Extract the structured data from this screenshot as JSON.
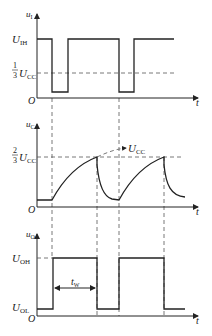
{
  "diagram": {
    "panels": [
      {
        "id": "input",
        "y_axis_label": "u",
        "y_axis_sub": "I",
        "x_axis_label": "t",
        "origin_label": "O",
        "levels": [
          {
            "label": "U",
            "sub": "IH"
          },
          {
            "frac_num": "1",
            "frac_den": "3",
            "label": "U",
            "sub": "CC"
          }
        ]
      },
      {
        "id": "capacitor",
        "y_axis_label": "u",
        "y_axis_sub": "C",
        "x_axis_label": "t",
        "origin_label": "O",
        "levels": [
          {
            "frac_num": "2",
            "frac_den": "3",
            "label": "U",
            "sub": "CC"
          }
        ],
        "asymptote_label": "U",
        "asymptote_sub": "CC"
      },
      {
        "id": "output",
        "y_axis_label": "u",
        "y_axis_sub": "O",
        "x_axis_label": "t",
        "origin_label": "O",
        "levels": [
          {
            "label": "U",
            "sub": "OH"
          },
          {
            "label": "U",
            "sub": "OL"
          }
        ],
        "pulse_width_label": "t",
        "pulse_width_sub": "W"
      }
    ],
    "colors": {
      "line": "#222222",
      "dashed": "#555555",
      "background": "#ffffff"
    }
  }
}
